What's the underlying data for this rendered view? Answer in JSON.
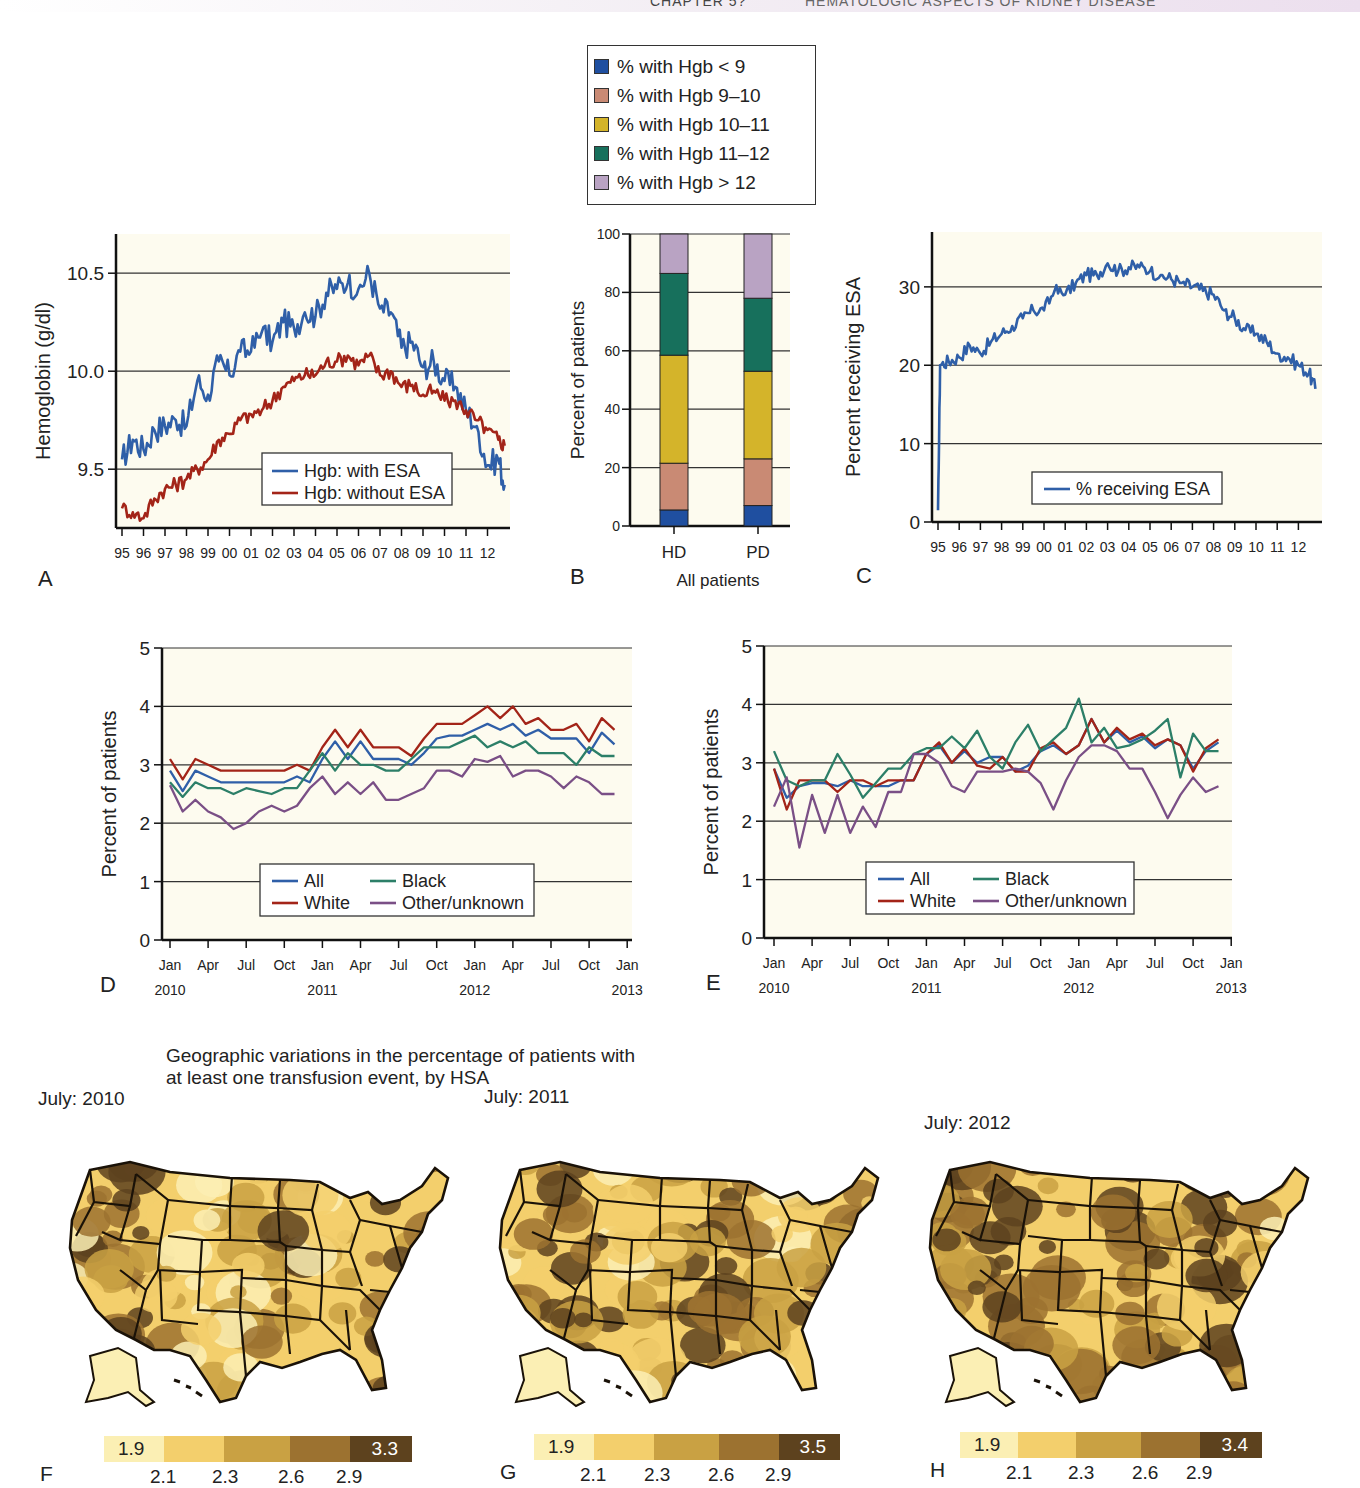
{
  "header": {
    "chapter": "CHAPTER 5?",
    "title": "HEMATOLOGIC ASPECTS OF KIDNEY DISEASE"
  },
  "colors": {
    "plot_bg": "#fdfbef",
    "blue": "#2f5fa8",
    "red": "#a32418",
    "green": "#2c7f68",
    "purple": "#7a4f86",
    "hgb_lt9": "#1f4fa0",
    "hgb_9_10": "#c98a74",
    "hgb_10_11": "#d4b42a",
    "hgb_11_12": "#17705c",
    "hgb_gt12": "#b9a3c3"
  },
  "chart_data": [
    {
      "id": "A",
      "type": "line",
      "title": "",
      "panel_label": "A",
      "xlabel": "",
      "ylabel": "Hemoglobin (g/dl)",
      "ylim": [
        9.2,
        10.7
      ],
      "yticks": [
        9.5,
        10.0,
        10.5
      ],
      "ytick_labels": [
        "9.5",
        "10.0",
        "10.5"
      ],
      "grid": true,
      "x_tick_labels": [
        "95",
        "96",
        "97",
        "98",
        "99",
        "00",
        "01",
        "02",
        "03",
        "04",
        "05",
        "06",
        "07",
        "08",
        "09",
        "10",
        "11",
        "12"
      ],
      "x": [
        1995.0,
        1995.5,
        1996.0,
        1996.5,
        1997.0,
        1997.5,
        1998.0,
        1998.5,
        1999.0,
        1999.5,
        2000.0,
        2000.5,
        2001.0,
        2001.5,
        2002.0,
        2002.5,
        2003.0,
        2003.5,
        2004.0,
        2004.5,
        2005.0,
        2005.5,
        2006.0,
        2006.5,
        2007.0,
        2007.5,
        2008.0,
        2008.5,
        2009.0,
        2009.5,
        2010.0,
        2010.5,
        2011.0,
        2011.5,
        2012.0,
        2012.5,
        2012.8
      ],
      "series": [
        {
          "name": "Hgb: with ESA",
          "color_key": "blue",
          "values": [
            9.55,
            9.65,
            9.6,
            9.7,
            9.72,
            9.75,
            9.72,
            9.95,
            9.88,
            10.05,
            9.98,
            10.1,
            10.1,
            10.2,
            10.15,
            10.25,
            10.22,
            10.3,
            10.28,
            10.4,
            10.42,
            10.45,
            10.42,
            10.5,
            10.32,
            10.3,
            10.12,
            10.15,
            10.02,
            10.05,
            9.95,
            9.92,
            9.8,
            9.72,
            9.52,
            9.55,
            9.42
          ]
        },
        {
          "name": "Hgb: without ESA",
          "color_key": "red",
          "values": [
            9.3,
            9.28,
            9.25,
            9.35,
            9.4,
            9.42,
            9.45,
            9.5,
            9.55,
            9.65,
            9.68,
            9.75,
            9.78,
            9.8,
            9.85,
            9.92,
            9.95,
            9.98,
            9.98,
            10.05,
            10.05,
            10.08,
            10.03,
            10.08,
            9.98,
            10.0,
            9.92,
            9.93,
            9.88,
            9.9,
            9.85,
            9.85,
            9.8,
            9.75,
            9.7,
            9.65,
            9.62
          ]
        }
      ],
      "legend": [
        "Hgb: with ESA",
        "Hgb: without ESA"
      ],
      "legend_position": "lower right"
    },
    {
      "id": "B",
      "type": "bar",
      "stacked": true,
      "panel_label": "B",
      "xlabel": "All patients",
      "ylabel": "Percent of patients",
      "ylim": [
        0,
        100
      ],
      "yticks": [
        0,
        20,
        40,
        60,
        80,
        100
      ],
      "categories": [
        "HD",
        "PD"
      ],
      "series": [
        {
          "name": "% with Hgb < 9",
          "color_key": "hgb_lt9",
          "values": [
            5.5,
            7
          ]
        },
        {
          "name": "% with Hgb 9–10",
          "color_key": "hgb_9_10",
          "values": [
            16,
            16
          ]
        },
        {
          "name": "% with Hgb 10–11",
          "color_key": "hgb_10_11",
          "values": [
            37,
            30
          ]
        },
        {
          "name": "% with Hgb 11–12",
          "color_key": "hgb_11_12",
          "values": [
            28,
            25
          ]
        },
        {
          "name": "% with Hgb > 12",
          "color_key": "hgb_gt12",
          "values": [
            13.5,
            22
          ]
        }
      ],
      "legend_position": "top (separate box)"
    },
    {
      "id": "C",
      "type": "line",
      "panel_label": "C",
      "ylabel": "Percent receiving ESA",
      "ylim": [
        0,
        37
      ],
      "yticks": [
        0,
        10,
        20,
        30
      ],
      "grid": true,
      "x_tick_labels": [
        "95",
        "96",
        "97",
        "98",
        "99",
        "00",
        "01",
        "02",
        "03",
        "04",
        "05",
        "06",
        "07",
        "08",
        "09",
        "10",
        "11",
        "12"
      ],
      "x": [
        1995.0,
        1995.1,
        1995.5,
        1996.0,
        1996.5,
        1997.0,
        1997.5,
        1998.0,
        1998.5,
        1999.0,
        1999.5,
        2000.0,
        2000.5,
        2001.0,
        2001.5,
        2002.0,
        2002.5,
        2003.0,
        2003.5,
        2004.0,
        2004.5,
        2005.0,
        2005.5,
        2006.0,
        2006.5,
        2007.0,
        2007.5,
        2008.0,
        2008.5,
        2009.0,
        2009.5,
        2010.0,
        2010.5,
        2011.0,
        2011.5,
        2012.0,
        2012.5,
        2012.8
      ],
      "series": [
        {
          "name": "% receiving ESA",
          "color_key": "blue",
          "values": [
            1.5,
            20,
            20.5,
            21,
            22.5,
            21.5,
            23,
            24,
            25,
            26,
            27,
            27,
            29.5,
            29,
            30.5,
            31.5,
            31.5,
            33,
            32,
            32.5,
            32.5,
            32,
            31.5,
            31,
            30.5,
            30,
            29.5,
            29,
            27,
            26,
            24.5,
            24,
            23,
            21.5,
            21,
            20,
            19,
            17,
            14.5
          ]
        }
      ],
      "legend": [
        "% receiving ESA"
      ],
      "legend_position": "lower center"
    },
    {
      "id": "D",
      "type": "line",
      "panel_label": "D",
      "ylabel": "Percent of patients",
      "ylim": [
        0,
        5
      ],
      "yticks": [
        0,
        1,
        2,
        3,
        4,
        5
      ],
      "grid": true,
      "x_tick_labels": [
        "Jan",
        "Apr",
        "Jul",
        "Oct",
        "Jan",
        "Apr",
        "Jul",
        "Oct",
        "Jan",
        "Apr",
        "Jul",
        "Oct",
        "Jan"
      ],
      "x_year_labels": [
        "2010",
        "2011",
        "2012",
        "2013"
      ],
      "months": 35,
      "series": [
        {
          "name": "All",
          "color_key": "blue",
          "values": [
            2.9,
            2.55,
            2.9,
            2.8,
            2.7,
            2.7,
            2.7,
            2.7,
            2.7,
            2.7,
            2.8,
            2.7,
            3.1,
            3.4,
            3.1,
            3.4,
            3.1,
            3.1,
            3.1,
            3.0,
            3.2,
            3.45,
            3.5,
            3.5,
            3.6,
            3.7,
            3.6,
            3.7,
            3.5,
            3.6,
            3.45,
            3.45,
            3.45,
            3.2,
            3.55,
            3.35
          ]
        },
        {
          "name": "White",
          "color_key": "red",
          "values": [
            3.1,
            2.75,
            3.1,
            3.0,
            2.9,
            2.9,
            2.9,
            2.9,
            2.9,
            2.9,
            3.0,
            2.9,
            3.3,
            3.6,
            3.3,
            3.6,
            3.3,
            3.3,
            3.3,
            3.15,
            3.45,
            3.7,
            3.7,
            3.7,
            3.85,
            4.0,
            3.8,
            4.0,
            3.7,
            3.8,
            3.6,
            3.6,
            3.7,
            3.4,
            3.8,
            3.6
          ]
        },
        {
          "name": "Black",
          "color_key": "green",
          "values": [
            2.7,
            2.45,
            2.7,
            2.6,
            2.6,
            2.5,
            2.6,
            2.55,
            2.5,
            2.6,
            2.6,
            2.9,
            3.2,
            2.9,
            3.2,
            3.0,
            3.0,
            2.9,
            2.9,
            3.1,
            3.3,
            3.3,
            3.3,
            3.4,
            3.5,
            3.3,
            3.4,
            3.3,
            3.4,
            3.2,
            3.2,
            3.2,
            3.0,
            3.3,
            3.15,
            3.15
          ]
        },
        {
          "name": "Other/unknown",
          "color_key": "purple",
          "values": [
            2.65,
            2.2,
            2.4,
            2.2,
            2.1,
            1.9,
            2.0,
            2.2,
            2.3,
            2.2,
            2.3,
            2.6,
            2.8,
            2.5,
            2.7,
            2.5,
            2.7,
            2.4,
            2.4,
            2.5,
            2.6,
            2.9,
            2.9,
            2.8,
            3.1,
            3.05,
            3.15,
            2.8,
            2.9,
            2.9,
            2.8,
            2.6,
            2.8,
            2.7,
            2.5,
            2.5
          ]
        }
      ],
      "legend": [
        "All",
        "Black",
        "White",
        "Other/unknown"
      ],
      "legend_position": "lower center"
    },
    {
      "id": "E",
      "type": "line",
      "panel_label": "E",
      "ylabel": "Percent of patients",
      "ylim": [
        0,
        5
      ],
      "yticks": [
        0,
        1,
        2,
        3,
        4,
        5
      ],
      "grid": true,
      "x_tick_labels": [
        "Jan",
        "Apr",
        "Jul",
        "Oct",
        "Jan",
        "Apr",
        "Jul",
        "Oct",
        "Jan",
        "Apr",
        "Jul",
        "Oct",
        "Jan"
      ],
      "x_year_labels": [
        "2010",
        "2011",
        "2012",
        "2013"
      ],
      "months": 35,
      "series": [
        {
          "name": "All",
          "color_key": "blue",
          "values": [
            2.9,
            2.4,
            2.6,
            2.65,
            2.65,
            2.6,
            2.7,
            2.6,
            2.6,
            2.6,
            2.7,
            2.7,
            3.15,
            3.3,
            3.0,
            3.2,
            3.0,
            3.1,
            3.1,
            2.85,
            2.95,
            3.2,
            3.3,
            3.15,
            3.3,
            3.75,
            3.35,
            3.55,
            3.35,
            3.45,
            3.25,
            3.4,
            3.3,
            2.9,
            3.2,
            3.35
          ]
        },
        {
          "name": "White",
          "color_key": "red",
          "values": [
            2.9,
            2.2,
            2.7,
            2.7,
            2.7,
            2.5,
            2.7,
            2.7,
            2.6,
            2.7,
            2.7,
            2.7,
            3.15,
            3.35,
            3.0,
            3.25,
            2.95,
            2.9,
            3.1,
            2.85,
            2.85,
            3.25,
            3.35,
            3.15,
            3.3,
            3.75,
            3.35,
            3.6,
            3.4,
            3.5,
            3.3,
            3.4,
            3.3,
            2.85,
            3.25,
            3.4
          ]
        },
        {
          "name": "Black",
          "color_key": "green",
          "values": [
            3.2,
            2.7,
            2.6,
            2.7,
            2.7,
            3.15,
            2.8,
            2.4,
            2.65,
            2.9,
            2.9,
            3.15,
            3.25,
            3.25,
            3.45,
            3.25,
            3.55,
            3.1,
            2.9,
            3.35,
            3.65,
            3.2,
            3.4,
            3.6,
            4.1,
            3.35,
            3.6,
            3.25,
            3.3,
            3.4,
            3.55,
            3.75,
            2.75,
            3.5,
            3.2,
            3.2
          ]
        },
        {
          "name": "Other/unknown",
          "color_key": "purple",
          "values": [
            2.25,
            2.75,
            1.55,
            2.45,
            1.8,
            2.45,
            1.8,
            2.25,
            1.9,
            2.5,
            2.5,
            3.15,
            3.15,
            3.0,
            2.6,
            2.5,
            2.85,
            2.85,
            2.85,
            2.9,
            2.85,
            2.65,
            2.2,
            2.7,
            3.1,
            3.3,
            3.3,
            3.2,
            2.9,
            2.9,
            2.5,
            2.05,
            2.45,
            2.75,
            2.5,
            2.6
          ]
        }
      ],
      "legend": [
        "All",
        "Black",
        "White",
        "Other/unknown"
      ],
      "legend_position": "lower center"
    },
    {
      "id": "F-H",
      "type": "heatmap",
      "title": "Geographic variations in the percentage of patients with at least one transfusion event, by HSA",
      "maps": [
        {
          "panel_label": "F",
          "label": "July: 2010",
          "scale_min": "1.9",
          "scale_max": "3.3",
          "breaks": [
            "2.1",
            "2.3",
            "2.6",
            "2.9"
          ]
        },
        {
          "panel_label": "G",
          "label": "July: 2011",
          "scale_min": "1.9",
          "scale_max": "3.5",
          "breaks": [
            "2.1",
            "2.3",
            "2.6",
            "2.9"
          ]
        },
        {
          "panel_label": "H",
          "label": "July: 2012",
          "scale_min": "1.9",
          "scale_max": "3.4",
          "breaks": [
            "2.1",
            "2.3",
            "2.6",
            "2.9"
          ]
        }
      ],
      "scale_colors": [
        "#fbefb4",
        "#f3cf6c",
        "#c9a143",
        "#9c7230",
        "#5d421e"
      ]
    }
  ],
  "legend_b": {
    "items": [
      {
        "label": "% with Hgb < 9",
        "color_key": "hgb_lt9"
      },
      {
        "label": "% with Hgb 9–10",
        "color_key": "hgb_9_10"
      },
      {
        "label": "% with Hgb 10–11",
        "color_key": "hgb_10_11"
      },
      {
        "label": "% with Hgb 11–12",
        "color_key": "hgb_11_12"
      },
      {
        "label": "% with Hgb > 12",
        "color_key": "hgb_gt12"
      }
    ]
  }
}
